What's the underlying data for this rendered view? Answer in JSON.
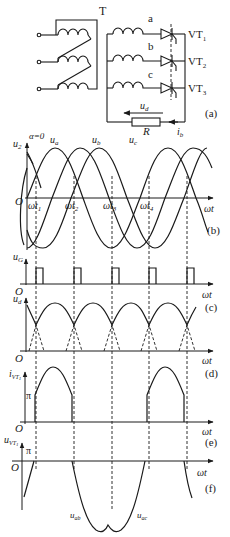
{
  "circuit": {
    "transformer_label": "T",
    "phase_labels": [
      "a",
      "b",
      "c"
    ],
    "thyristor_labels": [
      "VT",
      "VT",
      "VT"
    ],
    "thyristor_subs": [
      "1",
      "2",
      "3"
    ],
    "load_voltage_label": "u",
    "load_voltage_sub": "d",
    "resistor_label": "R",
    "current_label": "i",
    "current_sub": "b",
    "panel_label": "(a)"
  },
  "panels": {
    "b": {
      "label": "(b)",
      "y_label": "u",
      "y_sub": "2",
      "alpha_label": "α=0",
      "origin": "O",
      "x_label": "ωt",
      "curve_labels": [
        {
          "main": "u",
          "sub": "a"
        },
        {
          "main": "u",
          "sub": "b"
        },
        {
          "main": "u",
          "sub": "c"
        }
      ],
      "time_marks": [
        {
          "main": "ωt",
          "sub": "1"
        },
        {
          "main": "ωt",
          "sub": "2"
        },
        {
          "main": "ωt",
          "sub": "3"
        },
        {
          "main": "ωt",
          "sub": "4"
        }
      ]
    },
    "c": {
      "label": "(c)",
      "y_label": "u",
      "y_sub": "G",
      "origin": "O",
      "x_label": "ωt"
    },
    "d": {
      "label": "(d)",
      "y_label": "u",
      "y_sub": "d",
      "origin": "O",
      "x_label": "ωt"
    },
    "e": {
      "label": "(e)",
      "y_label": "i",
      "y_sub": "VT",
      "y_sub2": "1",
      "pi_label": "π",
      "origin": "O",
      "x_label": "ωt"
    },
    "f": {
      "label": "(f)",
      "y_label": "u",
      "y_sub": "VT",
      "y_sub2": "1",
      "pi_label": "π",
      "origin": "O",
      "x_label": "ωt",
      "curve_labels": [
        {
          "main": "u",
          "sub": "ab"
        },
        {
          "main": "u",
          "sub": "ac"
        }
      ]
    }
  }
}
